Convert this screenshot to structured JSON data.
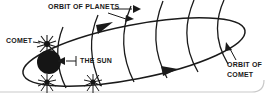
{
  "figure": {
    "type": "astronomy-diagram",
    "title_visible": false,
    "background_color": "#ffffff",
    "ink_color": "#1a1a1a",
    "width": 268,
    "height": 101
  },
  "labels": {
    "orbit_of_planets": "ORBIT OF PLANETS",
    "comet": "COMET",
    "the_sun": "THE SUN",
    "orbit_of_comet_line1": "ORBIT OF",
    "orbit_of_comet_line2": "COMET"
  },
  "objects": {
    "sun": {
      "name": "the-sun",
      "shape": "filled-circle",
      "cx": 49,
      "cy": 62,
      "r": 12
    },
    "comet_nucleus": {
      "name": "comet",
      "shape": "starburst",
      "cx": 47,
      "cy": 44
    },
    "planets": [
      {
        "name": "planet-burst-left",
        "cx": 47,
        "cy": 82
      },
      {
        "name": "planet-burst-right",
        "cx": 93,
        "cy": 82
      }
    ]
  },
  "orbits": {
    "comet_orbit": {
      "name": "orbit-of-comet",
      "shape": "tilted-ellipse",
      "direction_arrows": 2
    },
    "planet_orbit_arcs": {
      "name": "orbit-of-planets",
      "count": 6
    }
  },
  "annotations": {
    "planets_leader": {
      "from": "ORBIT OF PLANETS",
      "to": "planet orbit arcs",
      "arrowheads": 2
    },
    "sun_leader": {
      "from": "THE SUN",
      "to": "sun",
      "arrowheads": 1
    },
    "comet_leader": {
      "from": "COMET",
      "to": "comet starburst",
      "arrowheads": 0
    },
    "comet_orbit_leader": {
      "from": "ORBIT OF COMET",
      "to": "comet orbit ellipse",
      "arrowheads": 1
    }
  }
}
